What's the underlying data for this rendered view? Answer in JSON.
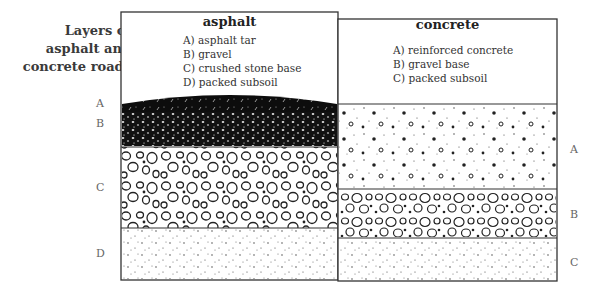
{
  "title": [
    "Layers of",
    "asphalt and",
    "concrete roads"
  ],
  "asphalt": {
    "heading": "asphalt",
    "items": [
      "A) asphalt tar",
      "B) gravel",
      "C) crushed stone base",
      "D) packed subsoil"
    ],
    "layer_labels": [
      "A",
      "B",
      "C",
      "D"
    ],
    "layers": [
      {
        "key": "A",
        "name": "asphalt tar",
        "pattern": "dark-dense"
      },
      {
        "key": "B",
        "name": "gravel",
        "pattern": "dark-speckled"
      },
      {
        "key": "C",
        "name": "crushed stone base",
        "pattern": "open-circles"
      },
      {
        "key": "D",
        "name": "packed subsoil",
        "pattern": "fine-dots"
      }
    ]
  },
  "concrete": {
    "heading": "concrete",
    "items": [
      "A) reinforced concrete",
      "B) gravel base",
      "C) packed subsoil"
    ],
    "layer_labels": [
      "A",
      "B",
      "C"
    ],
    "layers": [
      {
        "key": "A",
        "name": "reinforced concrete",
        "pattern": "dots-and-specks"
      },
      {
        "key": "B",
        "name": "gravel base",
        "pattern": "open-circles-small"
      },
      {
        "key": "C",
        "name": "packed subsoil",
        "pattern": "fine-dots"
      }
    ]
  }
}
